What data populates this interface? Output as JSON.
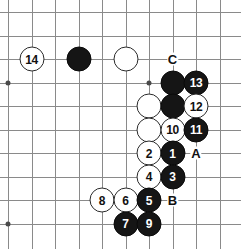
{
  "diagram": {
    "kind": "go-board-diagram",
    "board": {
      "columns": 10,
      "rows": 10,
      "origin_x": 8,
      "origin_y": 12,
      "spacing": 23.5,
      "line_color": "#8a8a8a",
      "background_color": "#ffffff"
    },
    "star_points": [
      {
        "col": 0,
        "row": 3
      },
      {
        "col": 6,
        "row": 3
      },
      {
        "col": 0,
        "row": 9
      }
    ],
    "stones": [
      {
        "id": "stone-w14",
        "color": "white",
        "label": "14",
        "col": 1,
        "row": 2
      },
      {
        "id": "stone-black-plain-c3r2",
        "color": "black",
        "label": "",
        "col": 3,
        "row": 2
      },
      {
        "id": "stone-white-plain-c5r2",
        "color": "white",
        "label": "",
        "col": 5,
        "row": 2
      },
      {
        "id": "stone-black-plain-c7r3",
        "color": "black",
        "label": "",
        "col": 7,
        "row": 3
      },
      {
        "id": "stone-b13",
        "color": "black",
        "label": "13",
        "col": 8,
        "row": 3
      },
      {
        "id": "stone-white-plain-c6r4",
        "color": "white",
        "label": "",
        "col": 6,
        "row": 4
      },
      {
        "id": "stone-black-plain-c7r4",
        "color": "black",
        "label": "",
        "col": 7,
        "row": 4
      },
      {
        "id": "stone-w12",
        "color": "white",
        "label": "12",
        "col": 8,
        "row": 4
      },
      {
        "id": "stone-white-plain-c6r5",
        "color": "white",
        "label": "",
        "col": 6,
        "row": 5
      },
      {
        "id": "stone-w10",
        "color": "white",
        "label": "10",
        "col": 7,
        "row": 5
      },
      {
        "id": "stone-b11",
        "color": "black",
        "label": "11",
        "col": 8,
        "row": 5
      },
      {
        "id": "stone-w2",
        "color": "white",
        "label": "2",
        "col": 6,
        "row": 6
      },
      {
        "id": "stone-b1",
        "color": "black",
        "label": "1",
        "col": 7,
        "row": 6
      },
      {
        "id": "stone-w4",
        "color": "white",
        "label": "4",
        "col": 6,
        "row": 7
      },
      {
        "id": "stone-b3",
        "color": "black",
        "label": "3",
        "col": 7,
        "row": 7
      },
      {
        "id": "stone-w8",
        "color": "white",
        "label": "8",
        "col": 4,
        "row": 8
      },
      {
        "id": "stone-w6",
        "color": "white",
        "label": "6",
        "col": 5,
        "row": 8
      },
      {
        "id": "stone-b5",
        "color": "black",
        "label": "5",
        "col": 6,
        "row": 8
      },
      {
        "id": "stone-b7",
        "color": "black",
        "label": "7",
        "col": 5,
        "row": 9
      },
      {
        "id": "stone-b9",
        "color": "black",
        "label": "9",
        "col": 6,
        "row": 9
      }
    ],
    "point_labels": [
      {
        "id": "label-c",
        "text": "C",
        "col": 7,
        "row": 2
      },
      {
        "id": "label-a",
        "text": "A",
        "col": 8,
        "row": 6
      },
      {
        "id": "label-b",
        "text": "B",
        "col": 7,
        "row": 8
      }
    ]
  }
}
